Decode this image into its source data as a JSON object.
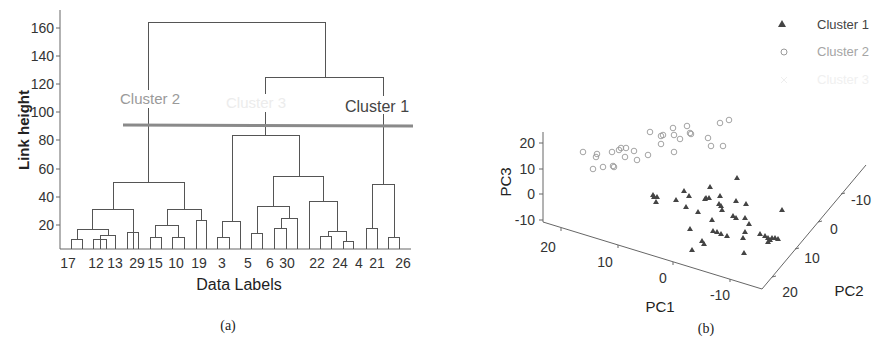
{
  "figure": {
    "panel_a_caption": "(a)",
    "panel_b_caption": "(b)"
  },
  "chart_data": [
    {
      "type": "dendrogram",
      "panel": "(a)",
      "title": "",
      "xlabel": "Data Labels",
      "ylabel": "Link height",
      "ylim": [
        0,
        170
      ],
      "yticks": [
        20,
        40,
        60,
        80,
        100,
        120,
        140,
        160
      ],
      "leaf_labels": [
        "17",
        "12",
        "13",
        "29",
        "15",
        "10",
        "19",
        "3",
        "5",
        "6",
        "30",
        "22",
        "24",
        "4",
        "21",
        "26"
      ],
      "cutoff_height": 91,
      "cluster_labels": [
        {
          "name": "Cluster 2",
          "color": "#9a9a9a"
        },
        {
          "name": "Cluster 3",
          "color": "#ececec"
        },
        {
          "name": "Cluster 1",
          "color": "#444444"
        }
      ],
      "merges": [
        {
          "height": 165,
          "joins": "Cluster 2 + (Cluster 3, Cluster 1)"
        },
        {
          "height": 125,
          "joins": "Cluster 3 + Cluster 1"
        },
        {
          "height": 84,
          "joins": "Cluster 3 subgroups"
        },
        {
          "height": 55,
          "joins": "Cluster 3 right subgroups"
        },
        {
          "height": 50,
          "joins": "Cluster 2 subgroups"
        },
        {
          "height": 49,
          "joins": "Cluster 1 subgroups (21, 26)"
        },
        {
          "height": 36,
          "joins": "22, 24, 4"
        },
        {
          "height": 33,
          "joins": "5, 6, 30"
        },
        {
          "height": 31,
          "joins": "17, 12, 13, 29"
        },
        {
          "height": 31,
          "joins": "15, 10, 19"
        },
        {
          "height": 24,
          "joins": "6, 30"
        },
        {
          "height": 22,
          "joins": "3"
        },
        {
          "height": 19,
          "joins": "15, 10"
        },
        {
          "height": 15,
          "joins": "24, 4"
        }
      ],
      "grid": false
    },
    {
      "type": "scatter3d",
      "panel": "(b)",
      "title": "",
      "xlabel": "PC1",
      "ylabel": "PC2",
      "zlabel": "PC3",
      "pc1_ticks": [
        20,
        10,
        0,
        -10
      ],
      "pc2_ticks": [
        20,
        10,
        0,
        -10
      ],
      "pc3_ticks": [
        20,
        10,
        0,
        -10
      ],
      "legend": [
        {
          "name": "Cluster 1",
          "marker": "triangle",
          "color": "#444444"
        },
        {
          "name": "Cluster 2",
          "marker": "circle-open",
          "color": "#9a9a9a"
        },
        {
          "name": "Cluster 3",
          "marker": "x",
          "color": "#eeeeee"
        }
      ],
      "legend_position": "upper right",
      "series": [
        {
          "name": "Cluster 1",
          "marker": "triangle",
          "screen_points": [
            [
              653,
              195
            ],
            [
              654,
              197
            ],
            [
              656,
              202
            ],
            [
              657,
              197
            ],
            [
              676,
              200
            ],
            [
              684,
              191
            ],
            [
              689,
              196
            ],
            [
              686,
              207
            ],
            [
              698,
              212
            ],
            [
              710,
              187
            ],
            [
              705,
              199
            ],
            [
              706,
              198
            ],
            [
              709,
              198
            ],
            [
              720,
              196
            ],
            [
              719,
              204
            ],
            [
              721,
              206
            ],
            [
              722,
              210
            ],
            [
              736,
              201
            ],
            [
              746,
              204
            ],
            [
              782,
              210
            ],
            [
              733,
              216
            ],
            [
              736,
              218
            ],
            [
              745,
              218
            ],
            [
              712,
              220
            ],
            [
              690,
              229
            ],
            [
              713,
              231
            ],
            [
              717,
              232
            ],
            [
              727,
              236
            ],
            [
              749,
              224
            ],
            [
              745,
              232
            ],
            [
              702,
              241
            ],
            [
              721,
              234
            ],
            [
              704,
              244
            ],
            [
              692,
              250
            ],
            [
              743,
              238
            ],
            [
              760,
              234
            ],
            [
              765,
              236
            ],
            [
              768,
              238
            ],
            [
              770,
              240
            ],
            [
              772,
              238
            ],
            [
              775,
              238
            ],
            [
              778,
              239
            ],
            [
              768,
              242
            ],
            [
              744,
              253
            ],
            [
              737,
              178
            ]
          ]
        },
        {
          "name": "Cluster 2",
          "marker": "circle-open",
          "screen_points": [
            [
              583,
              152
            ],
            [
              596,
              157
            ],
            [
              597,
              154
            ],
            [
              593,
              169
            ],
            [
              603,
              167
            ],
            [
              613,
              166
            ],
            [
              614,
              167
            ],
            [
              612,
              152
            ],
            [
              619,
              150
            ],
            [
              621,
              148
            ],
            [
              626,
              148
            ],
            [
              625,
              157
            ],
            [
              634,
              151
            ],
            [
              637,
              160
            ],
            [
              648,
              155
            ],
            [
              650,
              132
            ],
            [
              661,
              136
            ],
            [
              663,
              135
            ],
            [
              661,
              144
            ],
            [
              673,
              128
            ],
            [
              674,
              135
            ],
            [
              674,
              152
            ],
            [
              680,
              139
            ],
            [
              687,
              126
            ],
            [
              690,
              133
            ],
            [
              691,
              134
            ],
            [
              708,
              138
            ],
            [
              711,
              146
            ],
            [
              720,
              123
            ],
            [
              729,
              120
            ],
            [
              723,
              146
            ]
          ]
        },
        {
          "name": "Cluster 3",
          "marker": "x",
          "screen_points": []
        }
      ],
      "grid": false
    }
  ]
}
